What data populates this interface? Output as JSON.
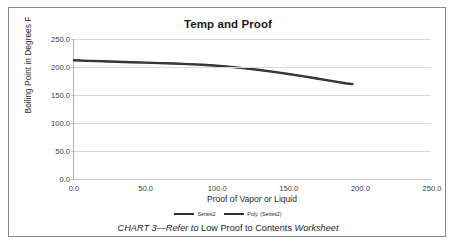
{
  "chart_data": {
    "type": "line",
    "title": "Temp and Proof",
    "xlabel": "Proof of Vapor or Liquid",
    "ylabel": "Boiling Point in Degrees F",
    "xlim": [
      0.0,
      250.0
    ],
    "ylim": [
      0.0,
      250.0
    ],
    "xticks": [
      "0.0",
      "50.0",
      "100.0",
      "150.0",
      "200.0",
      "250.0"
    ],
    "xtick_values": [
      0,
      50,
      100,
      150,
      200,
      250
    ],
    "yticks": [
      "0.0",
      "50.0",
      "100.0",
      "150.0",
      "200.0",
      "250.0"
    ],
    "ytick_values": [
      0,
      50,
      100,
      150,
      200,
      250
    ],
    "grid": "horizontal",
    "legend_position": "bottom",
    "legend": [
      "Series2",
      "Poly. (Series2)"
    ],
    "series": [
      {
        "name": "Series2",
        "x": [
          0,
          10,
          20,
          30,
          40,
          50,
          60,
          70,
          80,
          90,
          100,
          110,
          120,
          130,
          140,
          150,
          160,
          170,
          180,
          190,
          195
        ],
        "values": [
          212,
          211,
          210.2,
          209.4,
          208.6,
          207.8,
          207,
          206.2,
          205.2,
          204,
          202.3,
          200.2,
          197.6,
          194.6,
          191.2,
          187.6,
          183.6,
          179.4,
          175.2,
          171,
          169.5
        ]
      },
      {
        "name": "Poly. (Series2)",
        "x": [
          0,
          10,
          20,
          30,
          40,
          50,
          60,
          70,
          80,
          90,
          100,
          110,
          120,
          130,
          140,
          150,
          160,
          170,
          180,
          190,
          195
        ],
        "values": [
          212,
          211,
          210.2,
          209.4,
          208.6,
          207.8,
          207,
          206.2,
          205.2,
          204,
          202.3,
          200.2,
          197.6,
          194.6,
          191.2,
          187.6,
          183.6,
          179.4,
          175.2,
          171,
          169.5
        ]
      }
    ],
    "colors": {
      "series_line": "#2f2f2f",
      "gridline": "#d9d9d9",
      "axis": "#b4b4b4",
      "text": "#2b2b2b"
    }
  },
  "caption": {
    "prefix_italic": "CHART 3—Refer to",
    "middle_normal": " Low Proof to Contents ",
    "suffix_italic": "Worksheet"
  }
}
